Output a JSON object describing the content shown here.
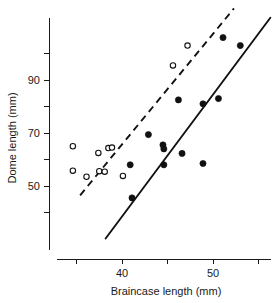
{
  "chart_data": {
    "type": "scatter",
    "title": "",
    "xlabel": "Braincase length (mm)",
    "ylabel": "Dome length (mm)",
    "xlim": [
      33.5,
      56.5
    ],
    "ylim": [
      36,
      112
    ],
    "grid": false,
    "legend": "none",
    "x_ticks": [
      {
        "value": 35,
        "label": ""
      },
      {
        "value": 40,
        "label": "40"
      },
      {
        "value": 45,
        "label": ""
      },
      {
        "value": 50,
        "label": "50"
      },
      {
        "value": 55,
        "label": ""
      }
    ],
    "y_ticks": [
      {
        "value": 40,
        "label": ""
      },
      {
        "value": 50,
        "label": "50"
      },
      {
        "value": 60,
        "label": ""
      },
      {
        "value": 70,
        "label": "70"
      },
      {
        "value": 80,
        "label": ""
      },
      {
        "value": 90,
        "label": "90"
      },
      {
        "value": 100,
        "label": ""
      }
    ],
    "series": [
      {
        "name": "open-circles",
        "marker": "open-circle",
        "points": [
          {
            "x": 34.6,
            "y": 65.0
          },
          {
            "x": 34.6,
            "y": 55.8
          },
          {
            "x": 36.1,
            "y": 53.5
          },
          {
            "x": 37.4,
            "y": 62.5
          },
          {
            "x": 37.5,
            "y": 55.6
          },
          {
            "x": 38.1,
            "y": 55.4
          },
          {
            "x": 38.5,
            "y": 64.3
          },
          {
            "x": 38.9,
            "y": 64.5
          },
          {
            "x": 40.1,
            "y": 53.8
          },
          {
            "x": 45.6,
            "y": 95.5
          },
          {
            "x": 47.2,
            "y": 103.0
          }
        ]
      },
      {
        "name": "filled-circles",
        "marker": "filled-circle",
        "points": [
          {
            "x": 40.9,
            "y": 58.0
          },
          {
            "x": 41.1,
            "y": 45.5
          },
          {
            "x": 42.9,
            "y": 69.4
          },
          {
            "x": 44.5,
            "y": 65.5
          },
          {
            "x": 44.6,
            "y": 64.0
          },
          {
            "x": 44.6,
            "y": 58.0
          },
          {
            "x": 46.2,
            "y": 82.5
          },
          {
            "x": 46.6,
            "y": 62.3
          },
          {
            "x": 48.9,
            "y": 81.0
          },
          {
            "x": 48.9,
            "y": 58.5
          },
          {
            "x": 50.6,
            "y": 83.0
          },
          {
            "x": 51.1,
            "y": 106.0
          },
          {
            "x": 53.0,
            "y": 103.0
          }
        ]
      }
    ],
    "fit_lines": [
      {
        "name": "dashed-regression-line",
        "style": "dashed",
        "x_start": 35.4,
        "y_start": 46.5,
        "x_end": 52.3,
        "y_end": 117.0
      },
      {
        "name": "solid-regression-line",
        "style": "solid",
        "x_start": 38.2,
        "y_start": 30.2,
        "x_end": 56.3,
        "y_end": 113.5
      }
    ]
  }
}
